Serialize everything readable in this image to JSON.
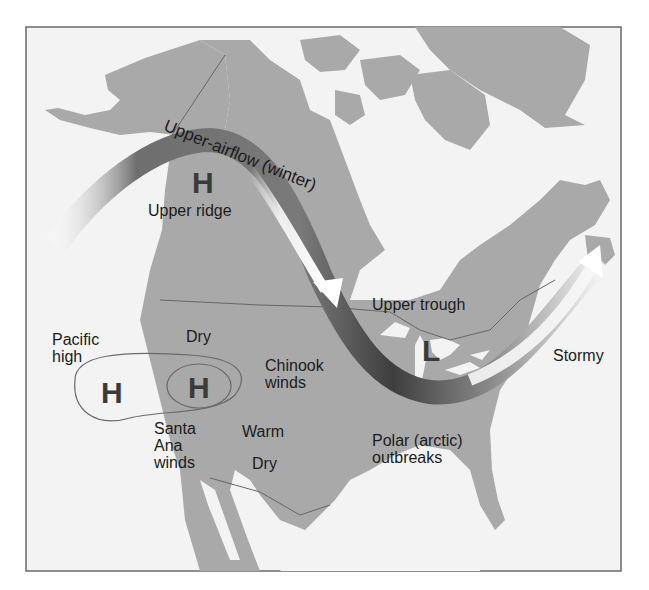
{
  "figure": {
    "title": "Upper-airflow (winter)",
    "labels": {
      "airflow": "Upper-airflow (winter)",
      "upper_ridge": "Upper ridge",
      "upper_ridge_symbol": "H",
      "upper_trough": "Upper trough",
      "trough_symbol": "L",
      "pacific_high_line1": "Pacific",
      "pacific_high_line2": "high",
      "pacific_high_symbol": "H",
      "great_basin_high_symbol": "H",
      "dry_north": "Dry",
      "chinook_line1": "Chinook",
      "chinook_line2": "winds",
      "santa_ana_line1": "Santa",
      "santa_ana_line2": "Ana",
      "santa_ana_line3": "winds",
      "warm": "Warm",
      "dry_south": "Dry",
      "polar_line1": "Polar (arctic)",
      "polar_line2": "outbreaks",
      "stormy": "Stormy"
    },
    "colors": {
      "land": "#a9a9a9",
      "water": "#f2f2f2",
      "frame": "#6a6a6a",
      "text": "#1c1c1c"
    }
  }
}
